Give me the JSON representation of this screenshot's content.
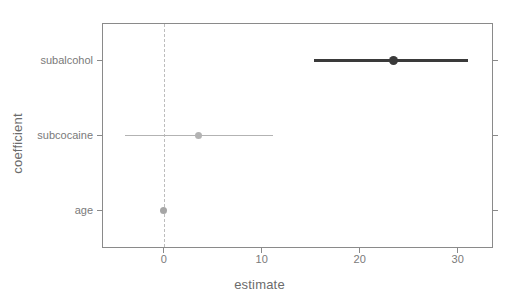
{
  "chart_data": {
    "type": "scatter",
    "subtype": "dot-and-whisker coefficient plot",
    "title": "",
    "xlabel": "estimate",
    "ylabel": "coefficient",
    "xlim": [
      -6.3,
      33.6
    ],
    "x_ticks": [
      0,
      10,
      20,
      30
    ],
    "x_tick_labels": [
      "0",
      "10",
      "20",
      "30"
    ],
    "categories": [
      "subalcohol",
      "subcocaine",
      "age"
    ],
    "grid": false,
    "legend": false,
    "reference_line": {
      "x": 0,
      "style": "dashed",
      "color": "#bdbdbd"
    },
    "points": [
      {
        "label": "subalcohol",
        "estimate": 23.4,
        "conf_low": 15.3,
        "conf_high": 31.0,
        "color": "#3a3a3a",
        "marker_size": 9,
        "line_width": 2.6
      },
      {
        "label": "subcocaine",
        "estimate": 3.5,
        "conf_low": -4.0,
        "conf_high": 11.1,
        "color": "#b3b3b3",
        "marker_size": 7,
        "line_width": 1.1
      },
      {
        "label": "age",
        "estimate": 0.0,
        "conf_low": 0.0,
        "conf_high": 0.0,
        "color": "#a6a6a6",
        "marker_size": 7,
        "line_width": 1.1
      }
    ]
  },
  "axes": {
    "x_title": "estimate",
    "y_title": "coefficient",
    "x_tick_labels": [
      "0",
      "10",
      "20",
      "30"
    ],
    "y_tick_labels": [
      "subalcohol",
      "subcocaine",
      "age"
    ]
  },
  "colors": {
    "panel_border": "#8a8a8a",
    "tick": "#8a8a8a",
    "text": "#6b6b6b",
    "tick_text": "#7a7a7a",
    "background": "#ffffff",
    "dark_series": "#3a3a3a",
    "light_series": "#b3b3b3",
    "reference": "#bdbdbd"
  }
}
